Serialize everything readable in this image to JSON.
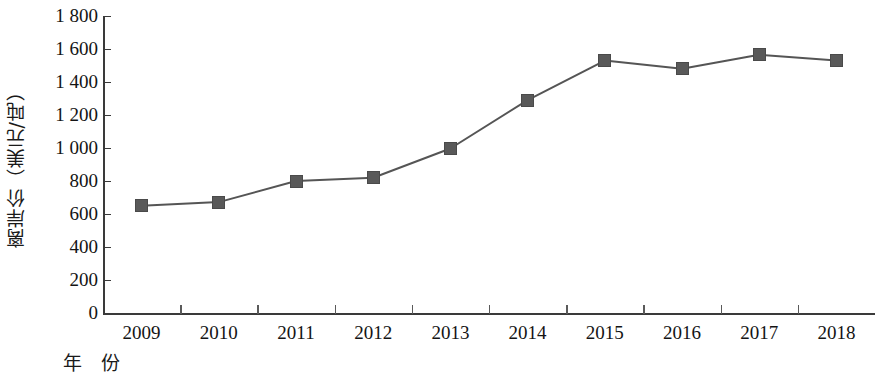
{
  "chart_data": {
    "type": "line",
    "title": "",
    "xlabel": "年  份",
    "ylabel": "离岸价（美元/吨）",
    "categories": [
      "2009",
      "2010",
      "2011",
      "2012",
      "2013",
      "2014",
      "2015",
      "2016",
      "2017",
      "2018"
    ],
    "values": [
      650,
      672,
      800,
      820,
      997,
      1290,
      1530,
      1480,
      1565,
      1530
    ],
    "series": [
      {
        "name": "离岸价",
        "values": [
          650,
          672,
          800,
          820,
          997,
          1290,
          1530,
          1480,
          1565,
          1530
        ]
      }
    ],
    "ylim": [
      0,
      1800
    ],
    "y_ticks": [
      0,
      200,
      400,
      600,
      800,
      1000,
      1200,
      1400,
      1600,
      1800
    ],
    "y_tick_labels": [
      "0",
      "200",
      "400",
      "600",
      "800",
      "1 000",
      "1 200",
      "1 400",
      "1 600",
      "1 800"
    ],
    "grid": false,
    "legend": "none",
    "marker": "square",
    "marker_color": "#595959",
    "line_color": "#555555"
  },
  "axes": {
    "y_title": "离岸价（美元/吨）",
    "x_title": "年  份"
  }
}
